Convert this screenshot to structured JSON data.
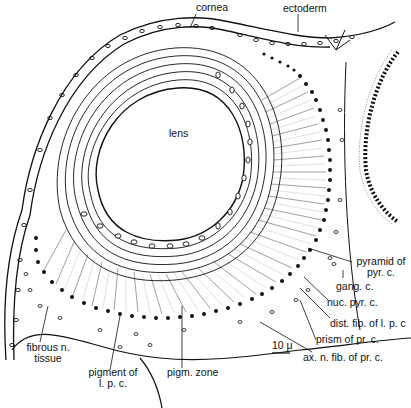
{
  "figure": {
    "type": "anatomical-illustration",
    "labels": {
      "cornea": "cornea",
      "ectoderm": "ectoderm",
      "lens": "lens",
      "pyramid": [
        "pyramid of",
        "pyr. c."
      ],
      "gang": "gang. c.",
      "nuc_pyr": "nuc. pyr. c.",
      "dist_fib": "dist. fib. of l. p. c",
      "prism": "prism of pr. c.",
      "ax_fib": "ax. n. fib. of pr. c.",
      "fibrous": [
        "fibrous n.",
        "tissue"
      ],
      "pigment": [
        "pigment of",
        "l. p. c."
      ],
      "pigm_zone": "pigm. zone",
      "scale_bar": "10 μ"
    },
    "colors": {
      "ink": "#111111",
      "background": "#ffffff"
    }
  }
}
